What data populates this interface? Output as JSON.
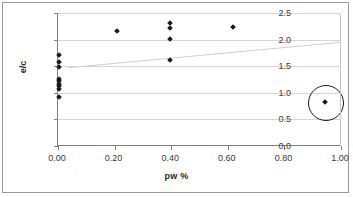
{
  "chart_data": {
    "type": "scatter",
    "title": "",
    "xlabel": "pw %",
    "ylabel": "e/c",
    "xlim": [
      0.0,
      1.0
    ],
    "ylim": [
      0.0,
      2.5
    ],
    "xticks": [
      "0.00",
      "0.20",
      "0.40",
      "0.60",
      "0.80",
      "1.00"
    ],
    "xtick_values": [
      0.0,
      0.2,
      0.4,
      0.6,
      0.8,
      1.0
    ],
    "yticks": [
      "0.0",
      "0.5",
      "1.0",
      "1.5",
      "2.0",
      "2.5"
    ],
    "ytick_values": [
      0.0,
      0.5,
      1.0,
      1.5,
      2.0,
      2.5
    ],
    "grid": "horizontal",
    "legend": "none",
    "series": [
      {
        "name": "e/c data",
        "marker": "diamond",
        "color": "#1a1a1a",
        "points": [
          {
            "x": 0.005,
            "y": 1.71
          },
          {
            "x": 0.005,
            "y": 1.58
          },
          {
            "x": 0.005,
            "y": 1.48
          },
          {
            "x": 0.005,
            "y": 1.26
          },
          {
            "x": 0.005,
            "y": 1.22
          },
          {
            "x": 0.005,
            "y": 1.16
          },
          {
            "x": 0.005,
            "y": 1.12
          },
          {
            "x": 0.005,
            "y": 1.08
          },
          {
            "x": 0.005,
            "y": 0.93
          },
          {
            "x": 0.21,
            "y": 2.16
          },
          {
            "x": 0.395,
            "y": 2.32
          },
          {
            "x": 0.395,
            "y": 2.21
          },
          {
            "x": 0.395,
            "y": 2.01
          },
          {
            "x": 0.395,
            "y": 1.61
          },
          {
            "x": 0.62,
            "y": 2.23
          },
          {
            "x": 0.945,
            "y": 0.83
          }
        ]
      }
    ],
    "trendline": {
      "name": "linear trend",
      "color": "#cfcfcf",
      "x0": 0.035,
      "y0": 1.47,
      "x1": 1.0,
      "y1": 1.95
    },
    "annotations": [
      {
        "type": "circle",
        "name": "outlier-highlight",
        "center_x": 0.945,
        "center_y": 0.83,
        "radius_px": 17
      }
    ]
  }
}
